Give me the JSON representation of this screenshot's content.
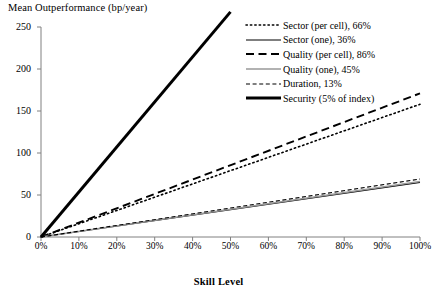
{
  "chart_data": {
    "type": "line",
    "title": "",
    "ylabel": "Mean Outperformance (bp/year)",
    "xlabel": "Skill Level",
    "xlim": [
      0,
      100
    ],
    "ylim": [
      0,
      250
    ],
    "grid": false,
    "legend_position": "top-right",
    "xticks": [
      "0%",
      "10%",
      "20%",
      "30%",
      "40%",
      "50%",
      "60%",
      "70%",
      "80%",
      "90%",
      "100%"
    ],
    "xtick_values": [
      0,
      10,
      20,
      30,
      40,
      50,
      60,
      70,
      80,
      90,
      100
    ],
    "yticks": [
      "0",
      "50",
      "100",
      "150",
      "200",
      "250"
    ],
    "ytick_values": [
      0,
      50,
      100,
      150,
      200,
      250
    ],
    "x": [
      0,
      100
    ],
    "series": [
      {
        "name": "Sector (per cell), 66%",
        "style": "dotted",
        "color": "#000000",
        "width": 1.6,
        "x": [
          0,
          100
        ],
        "values": [
          0,
          158
        ]
      },
      {
        "name": "Sector (one), 36%",
        "style": "solid",
        "color": "#000000",
        "width": 1.2,
        "x": [
          0,
          100
        ],
        "values": [
          0,
          65
        ]
      },
      {
        "name": "Quality (per cell), 86%",
        "style": "long-dash",
        "color": "#000000",
        "width": 1.9,
        "x": [
          0,
          100
        ],
        "values": [
          0,
          171
        ]
      },
      {
        "name": "Quality (one), 45%",
        "style": "solid",
        "color": "#999999",
        "width": 1.6,
        "x": [
          0,
          100
        ],
        "values": [
          0,
          66
        ]
      },
      {
        "name": "Duration, 13%",
        "style": "short-dash",
        "color": "#000000",
        "width": 1.1,
        "x": [
          0,
          100
        ],
        "values": [
          0,
          69
        ]
      },
      {
        "name": "Security (5% of index)",
        "style": "thick-solid",
        "color": "#000000",
        "width": 3.0,
        "x": [
          0,
          50
        ],
        "values": [
          0,
          268
        ]
      }
    ]
  },
  "axis": {
    "y_title": "Mean Outperformance (bp/year)",
    "x_title": "Skill Level",
    "y_ticks": [
      {
        "label": "250"
      },
      {
        "label": "200"
      },
      {
        "label": "150"
      },
      {
        "label": "100"
      },
      {
        "label": "50"
      },
      {
        "label": "0"
      }
    ],
    "x_ticks": [
      {
        "label": "0%"
      },
      {
        "label": "10%"
      },
      {
        "label": "20%"
      },
      {
        "label": "30%"
      },
      {
        "label": "40%"
      },
      {
        "label": "50%"
      },
      {
        "label": "60%"
      },
      {
        "label": "70%"
      },
      {
        "label": "80%"
      },
      {
        "label": "90%"
      },
      {
        "label": "100%"
      }
    ]
  },
  "legend": {
    "items": [
      {
        "label": "Sector (per cell), 66%"
      },
      {
        "label": "Sector (one), 36%"
      },
      {
        "label": "Quality (per cell), 86%"
      },
      {
        "label": "Quality (one), 45%"
      },
      {
        "label": "Duration, 13%"
      },
      {
        "label": "Security (5% of index)"
      }
    ]
  }
}
